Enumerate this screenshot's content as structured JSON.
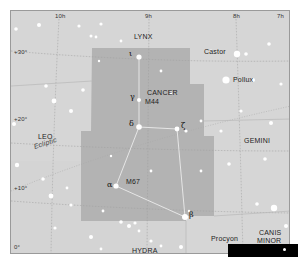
{
  "map": {
    "title": "Cancer constellation star chart",
    "colors": {
      "background": "#d6d6d6",
      "constellation_region": "#b3b3b3",
      "grid_lines": "#9f9f9f",
      "stick_lines": "#f2f2f2",
      "stars": "#ffffff"
    },
    "ra_labels": [
      "10h",
      "9h",
      "8h",
      "7h"
    ],
    "dec_labels": [
      "+30°",
      "+20°",
      "+10°",
      "0°"
    ],
    "constellations": {
      "highlighted": "CANCER",
      "neighbors": [
        "LYNX",
        "LEO",
        "GEMINI",
        "HYDRA",
        "CANIS MINOR"
      ]
    },
    "named_stars": [
      "Castor",
      "Pollux",
      "Procyon"
    ],
    "greek_stars": {
      "iota": "ι",
      "gamma": "γ",
      "delta": "δ",
      "zeta": "ζ",
      "alpha": "α",
      "beta": "β"
    },
    "deep_sky": [
      "M44",
      "M67"
    ],
    "ecliptic_label": "Ecliptic",
    "canis_minor_line1": "CANIS",
    "canis_minor_line2": "MINOR"
  }
}
